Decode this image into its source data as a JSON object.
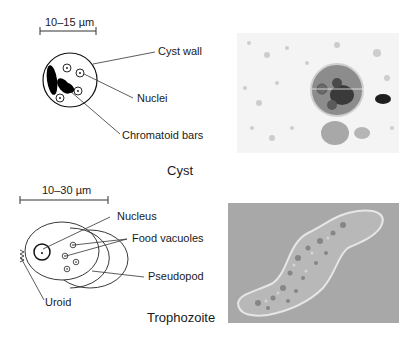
{
  "cyst_section": {
    "title": "Cyst",
    "scale_bar": "10–15 µm",
    "labels": {
      "cyst_wall": "Cyst wall",
      "nuclei": "Nuclei",
      "chromatoid_bars": "Chromatoid bars"
    },
    "photo": {
      "description": "Micrograph of stained cyst",
      "background": "#f2f2f2"
    }
  },
  "trophozoite_section": {
    "title": "Trophozoite",
    "scale_bar": "10–30 µm",
    "labels": {
      "nucleus": "Nucleus",
      "food_vacuoles": "Food vacuoles",
      "pseudopod": "Pseudopod",
      "uroid": "Uroid"
    },
    "photo": {
      "description": "Phase-contrast micrograph of trophozoite",
      "background": "#a8a8a8"
    }
  },
  "colors": {
    "ink": "#1a1a1a",
    "line": "#333333"
  }
}
